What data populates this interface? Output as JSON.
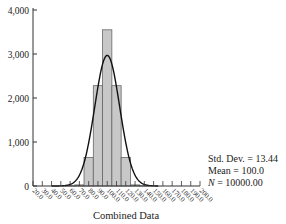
{
  "chart_data": {
    "type": "bar",
    "subtype": "histogram-with-normal-curve",
    "title": "",
    "xlabel": "Combined Data",
    "ylabel": "",
    "xlim": [
      20,
      200
    ],
    "ylim": [
      0,
      4000
    ],
    "yticks": [
      0,
      1000,
      2000,
      3000,
      4000
    ],
    "ytick_labels": [
      "0",
      "1,000",
      "2,000",
      "3,000",
      "4,000"
    ],
    "xtick_labels": [
      "20.0",
      "30.0",
      "40.0",
      "50.0",
      "60.0",
      "70.0",
      "80.0",
      "90.0",
      "100.0",
      "110.0",
      "120.0",
      "130.0",
      "140.0",
      "150.0",
      "160.0",
      "170.0",
      "180.0",
      "190.0",
      "200.0"
    ],
    "xticks": [
      20,
      30,
      40,
      50,
      60,
      70,
      80,
      90,
      100,
      110,
      120,
      130,
      140,
      150,
      160,
      170,
      180,
      190,
      200
    ],
    "bin_width": 10,
    "categories": [
      "60.0",
      "70.0",
      "80.0",
      "90.0",
      "100.0",
      "110.0",
      "120.0",
      "130.0",
      "140.0"
    ],
    "bin_centers": [
      60,
      70,
      80,
      90,
      100,
      110,
      120,
      130,
      140
    ],
    "values": [
      5,
      25,
      650,
      2280,
      3550,
      2280,
      650,
      25,
      5
    ],
    "normal_curve": {
      "mean": 100.0,
      "std_dev": 13.44,
      "n": 10000,
      "peak_approx": 2980
    },
    "stats": {
      "std_dev_label": "Std. Dev. = 13.44",
      "mean_label": "Mean = 100.0",
      "n_label_prefix": "N",
      "n_label_value": " = 10000.00"
    },
    "colors": {
      "bar_fill": "#c8c8c8",
      "bar_stroke": "#666666",
      "curve": "#111111",
      "axis": "#333333"
    },
    "grid": false,
    "legend": "none"
  }
}
